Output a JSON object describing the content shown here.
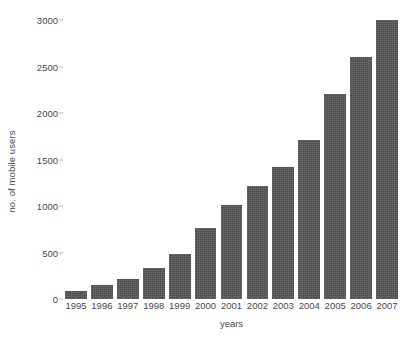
{
  "chart_data": {
    "type": "bar",
    "title": "",
    "subtitle": "",
    "xlabel": "years",
    "ylabel": "no. of mobile users",
    "categories": [
      "1995",
      "1996",
      "1997",
      "1998",
      "1999",
      "2000",
      "2001",
      "2002",
      "2003",
      "2004",
      "2005",
      "2006",
      "2007"
    ],
    "values": [
      90,
      150,
      215,
      330,
      480,
      760,
      1010,
      1210,
      1420,
      1710,
      2205,
      2600,
      3000
    ],
    "ylim": [
      0,
      3000
    ],
    "yticks": [
      0,
      500,
      1000,
      1500,
      2000,
      2500,
      3000
    ],
    "ytick_labels": [
      "0",
      "500",
      "1000",
      "1500",
      "2000",
      "2500",
      "3000"
    ],
    "grid": false,
    "legend": null,
    "legend_position": "none",
    "bar_color": "#4d4d4d",
    "background_color": "#ffffff",
    "text_color": "#494949"
  }
}
